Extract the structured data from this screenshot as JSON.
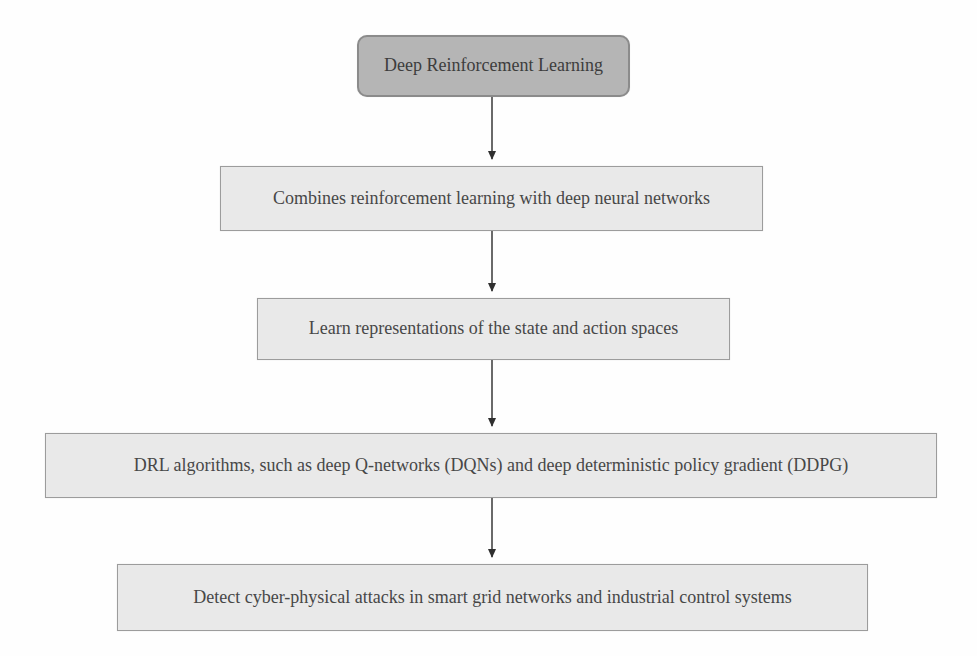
{
  "diagram": {
    "name": "Deep Reinforcement Learning flowchart",
    "colors": {
      "background": "#fefefe",
      "root_node_fill": "#b5b5b5",
      "root_node_border": "#8b8b8b",
      "node_fill": "#e9e9e9",
      "node_border": "#9c9c9c",
      "text": "#474747",
      "arrow": "#2f2f2f"
    },
    "nodes": [
      {
        "id": "drl",
        "variant": "root",
        "label": "Deep Reinforcement Learning"
      },
      {
        "id": "combines",
        "variant": "step",
        "label": "Combines reinforcement learning with deep neural networks"
      },
      {
        "id": "representations",
        "variant": "step",
        "label": "Learn representations of the state and action spaces"
      },
      {
        "id": "algorithms",
        "variant": "step",
        "label": "DRL algorithms, such as deep Q-networks (DQNs) and deep deterministic policy gradient (DDPG)"
      },
      {
        "id": "detect",
        "variant": "step",
        "label": "Detect cyber-physical attacks in smart grid networks and industrial control systems"
      }
    ],
    "edges": [
      {
        "from": "drl",
        "to": "combines",
        "direction": "down"
      },
      {
        "from": "combines",
        "to": "representations",
        "direction": "down"
      },
      {
        "from": "representations",
        "to": "algorithms",
        "direction": "down"
      },
      {
        "from": "algorithms",
        "to": "detect",
        "direction": "down"
      }
    ]
  }
}
